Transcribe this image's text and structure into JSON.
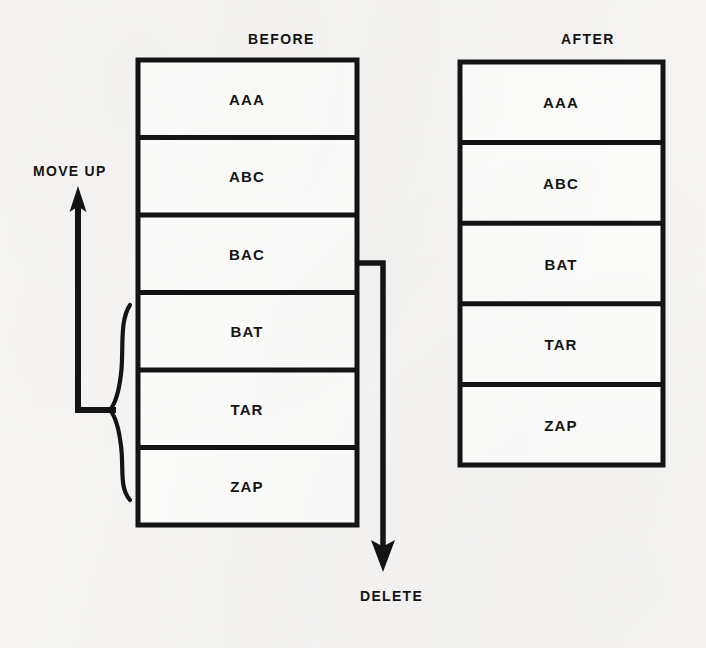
{
  "page": {
    "background_color": "#f6f5f3",
    "ink_color": "#141414",
    "width": 706,
    "height": 648
  },
  "diagram": {
    "type": "before-after-table-operation",
    "before": {
      "caption": "BEFORE",
      "caption_x": 248,
      "caption_y": 38,
      "box": {
        "x": 138,
        "y": 60,
        "width": 219,
        "height": 465
      },
      "row_count": 6,
      "rows": [
        {
          "label": "AAA"
        },
        {
          "label": "ABC"
        },
        {
          "label": "BAC"
        },
        {
          "label": "BAT"
        },
        {
          "label": "TAR"
        },
        {
          "label": "ZAP"
        }
      ]
    },
    "after": {
      "caption": "AFTER",
      "caption_x": 561,
      "caption_y": 38,
      "box": {
        "x": 460,
        "y": 62,
        "width": 203,
        "height": 403
      },
      "row_count": 5,
      "rows": [
        {
          "label": "AAA"
        },
        {
          "label": "ABC"
        },
        {
          "label": "BAT"
        },
        {
          "label": "TAR"
        },
        {
          "label": "ZAP"
        }
      ]
    },
    "annotations": [
      {
        "name": "move-up",
        "label": "MOVE UP",
        "label_x": 33,
        "label_y": 163,
        "arrow_direction": "up",
        "brace_rows": [
          "BAT",
          "TAR",
          "ZAP"
        ]
      },
      {
        "name": "delete",
        "label": "DELETE",
        "label_x": 360,
        "label_y": 588,
        "arrow_direction": "down",
        "source_row": "BAC"
      }
    ]
  }
}
